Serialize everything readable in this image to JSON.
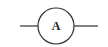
{
  "diagram": {
    "type": "circuit-symbol",
    "component": "ammeter",
    "symbol_label": "A",
    "stroke_color": "#333333",
    "background": "#ffffff"
  }
}
